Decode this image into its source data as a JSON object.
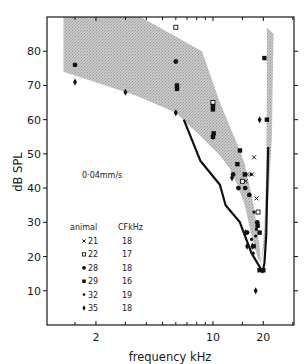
{
  "chart_data": {
    "type": "scatter",
    "title": "",
    "xlabel": "frequency kHz",
    "ylabel": "dB SPL",
    "xscale": "log",
    "xlim": [
      1.02,
      30.5
    ],
    "ylim": [
      0,
      90
    ],
    "x_ticks_labeled": [
      {
        "value": 2,
        "label": "2"
      },
      {
        "value": 10,
        "label": "10"
      },
      {
        "value": 20,
        "label": "20"
      }
    ],
    "x_ticks_minor": [
      1.5,
      3,
      4,
      5,
      6,
      7,
      8,
      9,
      15,
      30
    ],
    "y_ticks": [
      {
        "value": 10,
        "label": "10"
      },
      {
        "value": 20,
        "label": "20"
      },
      {
        "value": 30,
        "label": "30"
      },
      {
        "value": 40,
        "label": "40"
      },
      {
        "value": 50,
        "label": "50"
      },
      {
        "value": 60,
        "label": "60"
      },
      {
        "value": 70,
        "label": "70"
      },
      {
        "value": 80,
        "label": "80"
      }
    ],
    "grid": false,
    "annotation": "0·04mm/s",
    "legend": {
      "position": "lower-left",
      "header_animal": "animal",
      "header_cf": "CFkHz",
      "entries": [
        {
          "animal": "21",
          "marker": "cross",
          "cf": "18"
        },
        {
          "animal": "22",
          "marker": "open-square",
          "cf": "17"
        },
        {
          "animal": "28",
          "marker": "filled-circle",
          "cf": "18"
        },
        {
          "animal": "29",
          "marker": "filled-square",
          "cf": "16"
        },
        {
          "animal": "32",
          "marker": "small-dot",
          "cf": "19"
        },
        {
          "animal": "35",
          "marker": "diamond",
          "cf": "18"
        }
      ]
    },
    "shaded_band_main": [
      [
        1.28,
        90
      ],
      [
        3.7,
        90
      ],
      [
        8.6,
        80
      ],
      [
        11.0,
        65
      ],
      [
        14.5,
        51
      ],
      [
        15.5,
        47
      ],
      [
        17.5,
        35
      ],
      [
        19.0,
        23
      ],
      [
        19.4,
        18
      ],
      [
        18.4,
        20
      ],
      [
        17.0,
        26
      ],
      [
        15.5,
        35
      ],
      [
        14.0,
        41
      ],
      [
        12.5,
        46
      ],
      [
        10.8,
        50
      ],
      [
        8.5,
        55
      ],
      [
        6.0,
        62
      ],
      [
        3.5,
        67
      ],
      [
        1.28,
        74
      ]
    ],
    "shaded_band_right": [
      [
        21.0,
        87
      ],
      [
        23.0,
        85
      ],
      [
        22.5,
        55
      ],
      [
        21.6,
        40
      ],
      [
        20.6,
        25
      ],
      [
        19.4,
        18
      ],
      [
        20.3,
        28
      ],
      [
        20.8,
        45
      ],
      [
        21.0,
        70
      ]
    ],
    "threshold_line": [
      [
        6.7,
        60
      ],
      [
        8.4,
        48
      ],
      [
        11.0,
        41
      ],
      [
        11.9,
        35
      ],
      [
        14.5,
        30
      ],
      [
        17.0,
        21
      ],
      [
        19.0,
        17
      ],
      [
        19.8,
        15.5
      ],
      [
        20.3,
        18
      ],
      [
        20.8,
        26
      ],
      [
        21.4,
        52
      ]
    ],
    "series": [
      {
        "name": "21",
        "marker": "cross",
        "points": [
          [
            17.6,
            49
          ],
          [
            17.1,
            44
          ],
          [
            15.7,
            42
          ],
          [
            16.0,
            44
          ],
          [
            18.2,
            37
          ]
        ]
      },
      {
        "name": "22",
        "marker": "open-square",
        "points": [
          [
            6.0,
            87
          ],
          [
            10.0,
            65
          ],
          [
            18.6,
            33
          ],
          [
            15.0,
            42
          ]
        ]
      },
      {
        "name": "28",
        "marker": "filled-circle",
        "points": [
          [
            1.5,
            76
          ],
          [
            6.0,
            77
          ],
          [
            13.2,
            44
          ],
          [
            14.2,
            40
          ],
          [
            15.6,
            40
          ],
          [
            16.5,
            38
          ],
          [
            18.4,
            30
          ],
          [
            16.0,
            27
          ]
        ]
      },
      {
        "name": "29",
        "marker": "filled-square",
        "points": [
          [
            6.1,
            70
          ],
          [
            6.1,
            69
          ],
          [
            10.0,
            63
          ],
          [
            10.0,
            64
          ],
          [
            10.0,
            55
          ],
          [
            10.1,
            56
          ],
          [
            14.5,
            51
          ],
          [
            14.0,
            47
          ],
          [
            15.5,
            44
          ],
          [
            18.5,
            29
          ],
          [
            19.0,
            27
          ],
          [
            17.5,
            23
          ],
          [
            20.3,
            78
          ],
          [
            21.0,
            60
          ],
          [
            19.0,
            16
          ],
          [
            20.0,
            16
          ]
        ]
      },
      {
        "name": "32",
        "marker": "small-dot",
        "points": [
          [
            16.9,
            44
          ],
          [
            17.6,
            33
          ],
          [
            18.0,
            26
          ],
          [
            17.0,
            25
          ],
          [
            18.2,
            28
          ],
          [
            17.4,
            21
          ]
        ]
      },
      {
        "name": "35",
        "marker": "diamond",
        "points": [
          [
            1.5,
            71
          ],
          [
            3.0,
            68
          ],
          [
            6.0,
            62
          ],
          [
            10.0,
            55
          ],
          [
            13.0,
            43
          ],
          [
            15.7,
            27
          ],
          [
            16.0,
            23
          ],
          [
            19.0,
            60
          ],
          [
            18.0,
            10
          ],
          [
            17.2,
            23
          ]
        ]
      }
    ]
  }
}
